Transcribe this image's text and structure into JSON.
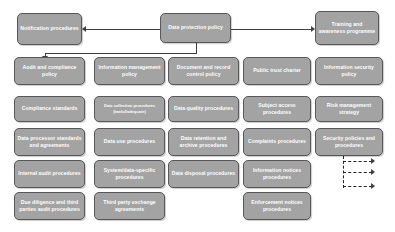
{
  "diagram": {
    "colors": {
      "box_fill": "#a3a3a3",
      "box_border": "#58585a",
      "box_text": "#ffffff",
      "connector": "#3f3f3f",
      "background": "#ffffff"
    },
    "nodes": {
      "notification_procedures": "Notification procedures",
      "data_protection_policy": "Data protection policy",
      "training_awareness": "Training and awareness programme",
      "audit_compliance_policy": "Audit and compliance policy",
      "information_management_policy": "Information management policy",
      "document_record_control_policy": "Document and record control policy",
      "public_trust_charter": "Public trust charter",
      "information_security_policy": "Information security policy",
      "compliance_standards": "Compliance standards",
      "data_collection_procedures": "Data collection procedures (lawful/adequate)",
      "data_quality_procedures": "Data quality procedures",
      "subject_access_procedures": "Subject access procedures",
      "risk_management_strategy": "Risk management strategy",
      "data_processor_standards": "Data processor standards and agreements",
      "data_use_procedures": "Data use procedures",
      "data_retention_archive": "Data retention and archive procedures",
      "complaints_procedures": "Complaints procedures",
      "security_policies_procedures": "Security policies and procedures",
      "internal_audit_procedures": "Internal audit procedures",
      "system_data_specific_procedures": "System/data-specific procedures",
      "data_disposal_procedures": "Data disposal procedures",
      "information_notices_procedures": "Information notices procedures",
      "due_diligence_third_parties": "Due diligence and third parties audit procedures",
      "third_party_exchange_agreements": "Third party exchange agreements",
      "enforcement_notices_procedures": "Enforcement notices procedures"
    }
  }
}
